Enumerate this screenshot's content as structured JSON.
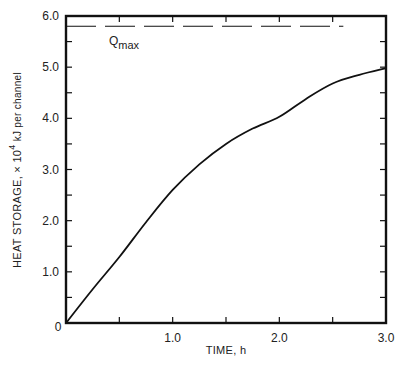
{
  "chart_data": {
    "type": "line",
    "title": "",
    "xlabel": "TIME, h",
    "ylabel": "HEAT STORAGE, × 10^4 kJ per channel",
    "ylabel_parts": {
      "main": "HEAT STORAGE, × 10",
      "sup": "4",
      "unit": " kJ per channel"
    },
    "xlim": [
      0,
      3.0
    ],
    "ylim": [
      0,
      6.0
    ],
    "x_ticks": [
      {
        "value": 0,
        "label": "0"
      },
      {
        "value": 1.0,
        "label": "1.0"
      },
      {
        "value": 2.0,
        "label": "2.0"
      },
      {
        "value": 3.0,
        "label": "3.0"
      }
    ],
    "y_ticks": [
      {
        "value": 1.0,
        "label": "1.0"
      },
      {
        "value": 2.0,
        "label": "2.0"
      },
      {
        "value": 3.0,
        "label": "3.0"
      },
      {
        "value": 4.0,
        "label": "4.0"
      },
      {
        "value": 5.0,
        "label": "5.0"
      },
      {
        "value": 6.0,
        "label": "6.0"
      }
    ],
    "x_minor_step": 0.5,
    "y_minor_step": 0.5,
    "grid": false,
    "series": [
      {
        "name": "Heat storage",
        "style": "solid",
        "x": [
          0,
          0.25,
          0.5,
          0.75,
          1.0,
          1.25,
          1.5,
          1.75,
          2.0,
          2.25,
          2.5,
          2.75,
          3.0
        ],
        "y": [
          0,
          0.66,
          1.29,
          1.97,
          2.6,
          3.1,
          3.5,
          3.8,
          4.03,
          4.38,
          4.68,
          4.85,
          4.98
        ]
      }
    ],
    "reference_lines": [
      {
        "name": "Qmax",
        "label_main": "Q",
        "label_sub": "max",
        "y": 5.8,
        "x_start": 0,
        "x_end": 2.6,
        "style": "dashed"
      }
    ]
  }
}
